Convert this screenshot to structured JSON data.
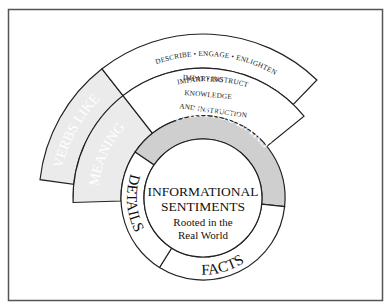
{
  "diagram": {
    "colors": {
      "frame": "#555555",
      "outline": "#222222",
      "light_gray": "#ebebeb",
      "mid_gray": "#cfcfcf",
      "white": "#ffffff"
    },
    "center": {
      "line1": "INFORMATIONAL",
      "line2": "SENTIMENTS",
      "line3": "Rooted in the",
      "line4": "Real World"
    },
    "inner_ring": {
      "segments": [
        {
          "label": "PARTICULARS",
          "fill": "#cfcfcf"
        },
        {
          "label": "FACTS",
          "fill": "#ffffff"
        },
        {
          "label": "DETAILS",
          "fill": "#ffffff"
        }
      ]
    },
    "middle_band": {
      "shaded_label": "MEANING",
      "lines": [
        "IMPARTING",
        "KNOWLEDGE",
        "AND INSTRUCTION"
      ]
    },
    "outer_band": {
      "shaded_label": "VERBS LIKE",
      "lines": [
        "DESCRIBE • ENGAGE • ENLIGHTEN",
        "IMPART • INSTRUCT"
      ]
    }
  }
}
